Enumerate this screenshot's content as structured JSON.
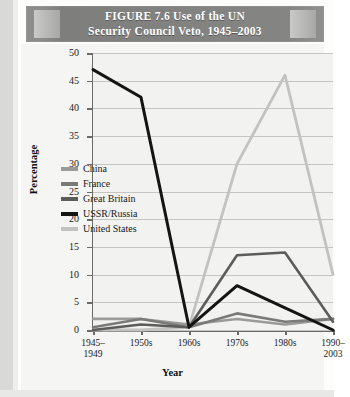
{
  "figure": {
    "title_line1": "FIGURE 7.6    Use of the UN",
    "title_line2": "Security Council Veto, 1945–2003"
  },
  "axis": {
    "ylabel": "Percentage",
    "xlabel": "Year"
  },
  "legend": {
    "items": [
      {
        "label": "China",
        "color": "#9a9a98"
      },
      {
        "label": "France",
        "color": "#7a7a78"
      },
      {
        "label": "Great Britain",
        "color": "#5c5c5a"
      },
      {
        "label": "USSR/Russia",
        "color": "#141414"
      },
      {
        "label": "United States",
        "color": "#c2c2c0"
      }
    ]
  },
  "chart_data": {
    "type": "line",
    "title": "FIGURE 7.6    Use of the UN Security Council Veto, 1945–2003",
    "xlabel": "Year",
    "ylabel": "Percentage",
    "ylim": [
      0,
      50
    ],
    "yticks": [
      0,
      5,
      10,
      15,
      20,
      25,
      30,
      35,
      40,
      45,
      50
    ],
    "ytick_labels": [
      "0",
      "5",
      "10",
      "15",
      "20",
      "25",
      "30",
      "35",
      "40",
      "45",
      "50"
    ],
    "grid": true,
    "legend_position": "inside-left",
    "categories": [
      "1945–1949",
      "1950s",
      "1960s",
      "1970s",
      "1980s",
      "1990–2003"
    ],
    "xtick_labels": [
      [
        "1945–",
        "1949"
      ],
      [
        "1950s",
        ""
      ],
      [
        "1960s",
        ""
      ],
      [
        "1970s",
        ""
      ],
      [
        "1980s",
        ""
      ],
      [
        "1990–",
        "2003"
      ]
    ],
    "series": [
      {
        "name": "China",
        "color": "#9a9a98",
        "width": 2.6,
        "values": [
          2,
          2,
          1,
          2,
          1,
          2
        ]
      },
      {
        "name": "France",
        "color": "#7a7a78",
        "width": 2.6,
        "values": [
          0.5,
          2,
          0.5,
          3,
          1.5,
          2
        ]
      },
      {
        "name": "Great Britain",
        "color": "#5c5c5a",
        "width": 2.6,
        "values": [
          0,
          1,
          0.5,
          13.5,
          14,
          1.5
        ]
      },
      {
        "name": "USSR/Russia",
        "color": "#141414",
        "width": 3.0,
        "values": [
          47,
          42,
          0.5,
          8,
          4,
          0
        ]
      },
      {
        "name": "United States",
        "color": "#c2c2c0",
        "width": 2.8,
        "values": [
          0,
          0,
          0.5,
          30,
          46,
          10
        ]
      }
    ]
  }
}
